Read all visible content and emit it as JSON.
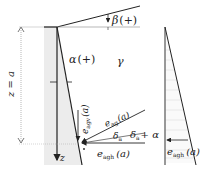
{
  "diagram": {
    "labels": {
      "beta": "β",
      "beta_sign": "(+)",
      "alpha": "α",
      "alpha_sign": "(+)",
      "gamma": "γ",
      "depth": "z = a",
      "z_axis": "z",
      "e_agv": "e",
      "e_agv_sub": "agv",
      "e_agv_arg": "(a)",
      "e_ag": "e",
      "e_ag_sub": "ag",
      "e_ag_arg": "(a)",
      "delta_a": "δ",
      "delta_a_sub": "a",
      "delta_alpha": "δ",
      "delta_alpha_sub": "a",
      "delta_alpha_plus": "+ α",
      "e_agh": "e",
      "e_agh_sub": "agh",
      "e_agh_arg": "(a)",
      "e_agh_right": "e",
      "e_agh_right_sub": "agh",
      "e_agh_right_arg": "(a)"
    },
    "colors": {
      "line": "#222222",
      "wall_fill": "#ececec",
      "hatch": "#cfcfcf",
      "dim": "#888888"
    }
  }
}
